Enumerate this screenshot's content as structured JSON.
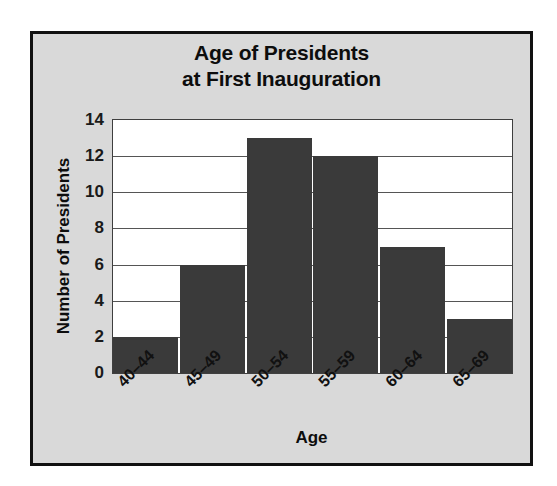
{
  "chart_data": {
    "type": "bar",
    "title": "Age of Presidents at First Inauguration",
    "title_lines": [
      "Age of Presidents",
      "at First Inauguration"
    ],
    "categories": [
      "40–44",
      "45–49",
      "50–54",
      "55–59",
      "60–64",
      "65–69"
    ],
    "values": [
      2,
      6,
      13,
      12,
      7,
      3
    ],
    "xlabel": "Age",
    "ylabel": "Number of Presidents",
    "ylim": [
      0,
      14
    ],
    "ytick_labels": [
      "0",
      "2",
      "4",
      "6",
      "8",
      "10",
      "12",
      "14"
    ],
    "ytick_values": [
      0,
      2,
      4,
      6,
      8,
      10,
      12,
      14
    ],
    "grid": true,
    "grid_axis": "y",
    "legend": false,
    "bar_color": "#3a3a3a",
    "plot_background": "#ffffff",
    "figure_background": "#d9d9d9",
    "frame_color": "#111111",
    "text_color": "#0d0d0d"
  }
}
